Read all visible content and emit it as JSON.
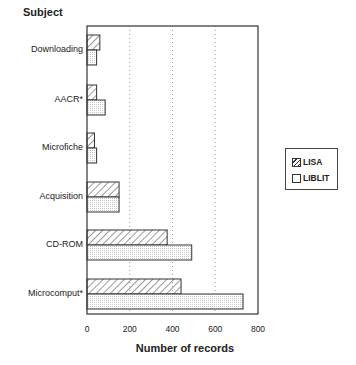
{
  "chart_data": {
    "type": "bar",
    "orientation": "horizontal",
    "title": "",
    "ylabel": "Subject",
    "xlabel": "Number of records",
    "categories": [
      "Downloading",
      "AACR*",
      "Microfiche",
      "Acquisition",
      "CD-ROM",
      "Microcomput*"
    ],
    "series": [
      {
        "name": "LISA",
        "pattern": "diagonal-hatch",
        "values": [
          60,
          45,
          35,
          150,
          375,
          440
        ]
      },
      {
        "name": "LIBLIT",
        "pattern": "light-dotted",
        "values": [
          45,
          85,
          45,
          150,
          490,
          730
        ]
      }
    ],
    "xlim": [
      0,
      800
    ],
    "xticks": [
      "0",
      "200",
      "400",
      "600",
      "800"
    ],
    "grid": "vertical dotted at 200, 400, 600",
    "legend_position": "right"
  },
  "labels": {
    "y_title": "Subject",
    "x_title": "Number of records",
    "ticks": [
      "0",
      "200",
      "400",
      "600",
      "800"
    ],
    "categories": [
      "Downloading",
      "AACR*",
      "Microfiche",
      "Acquisition",
      "CD-ROM",
      "Microcomput*"
    ],
    "legend": [
      "LISA",
      "LIBLIT"
    ]
  }
}
